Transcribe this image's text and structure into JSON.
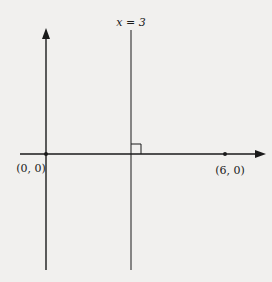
{
  "diagram": {
    "line_label": "x = 3",
    "origin_label": "(0, 0)",
    "point_label": "(6, 0)",
    "colors": {
      "background": "#f1f0ee",
      "ink": "#1a1a1a"
    }
  }
}
